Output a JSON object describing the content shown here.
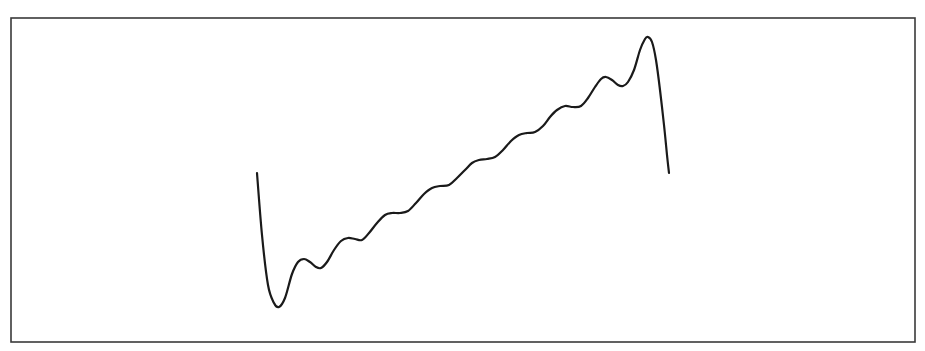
{
  "chart_data": {
    "type": "line",
    "title": "",
    "xlabel": "",
    "ylabel": "",
    "grid": false,
    "legend": null,
    "axes_visible": false,
    "frame": {
      "x": 11,
      "y": 18,
      "width": 904,
      "height": 324,
      "color": "#3a3a3a"
    },
    "series": [
      {
        "name": "curve",
        "color": "#1a1a1a",
        "description": "Sawtooth-like Fourier partial sum with Gibbs overshoot at both ends",
        "pixel_points": [
          [
            257,
            173
          ],
          [
            262,
            235
          ],
          [
            268,
            285
          ],
          [
            274,
            303
          ],
          [
            279,
            307
          ],
          [
            285,
            298
          ],
          [
            292,
            274
          ],
          [
            298,
            262
          ],
          [
            304,
            259
          ],
          [
            310,
            262
          ],
          [
            316,
            267
          ],
          [
            321,
            268
          ],
          [
            327,
            262
          ],
          [
            334,
            250
          ],
          [
            341,
            241
          ],
          [
            348,
            238
          ],
          [
            355,
            239
          ],
          [
            362,
            240
          ],
          [
            369,
            233
          ],
          [
            377,
            223
          ],
          [
            385,
            215
          ],
          [
            392,
            213
          ],
          [
            400,
            213
          ],
          [
            408,
            211
          ],
          [
            416,
            203
          ],
          [
            424,
            194
          ],
          [
            432,
            188
          ],
          [
            440,
            186
          ],
          [
            449,
            185
          ],
          [
            457,
            178
          ],
          [
            465,
            170
          ],
          [
            472,
            163
          ],
          [
            479,
            160
          ],
          [
            487,
            159
          ],
          [
            495,
            157
          ],
          [
            503,
            150
          ],
          [
            511,
            141
          ],
          [
            519,
            135
          ],
          [
            527,
            133
          ],
          [
            535,
            132
          ],
          [
            543,
            126
          ],
          [
            550,
            117
          ],
          [
            557,
            110
          ],
          [
            565,
            106
          ],
          [
            573,
            107
          ],
          [
            581,
            106
          ],
          [
            588,
            98
          ],
          [
            595,
            87
          ],
          [
            601,
            79
          ],
          [
            606,
            77
          ],
          [
            612,
            80
          ],
          [
            618,
            85
          ],
          [
            623,
            86
          ],
          [
            628,
            82
          ],
          [
            634,
            70
          ],
          [
            640,
            50
          ],
          [
            645,
            39
          ],
          [
            648,
            37
          ],
          [
            652,
            42
          ],
          [
            656,
            60
          ],
          [
            660,
            90
          ],
          [
            664,
            125
          ],
          [
            667,
            155
          ],
          [
            669,
            173
          ]
        ]
      }
    ]
  }
}
